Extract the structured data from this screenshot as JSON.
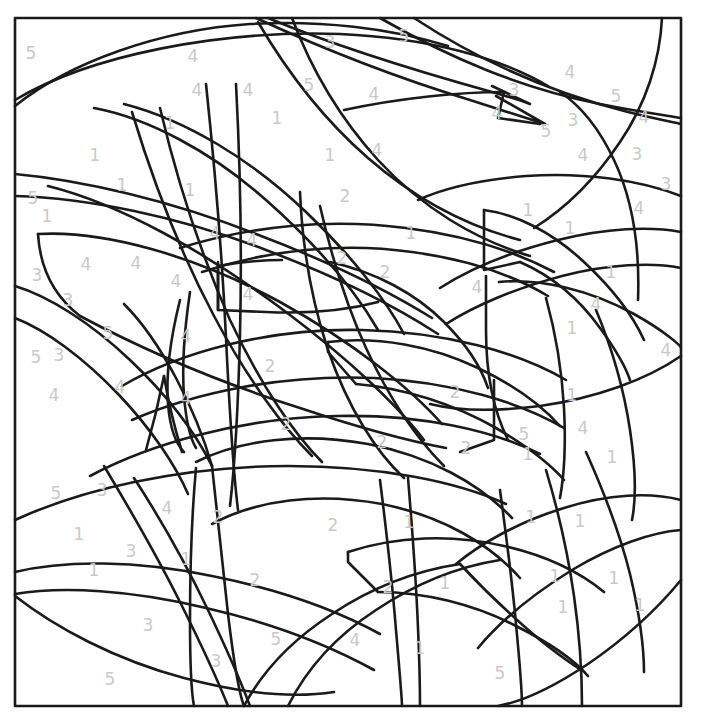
{
  "page": {
    "type": "color-by-number",
    "width": 702,
    "height": 726,
    "background_color": "#ffffff",
    "line_color": "#1a1a1a",
    "number_color": "#c9c9c9"
  },
  "frame": {
    "x": 15,
    "y": 18,
    "width": 666,
    "height": 688,
    "stroke_width": 2.6
  },
  "legend": {
    "palette_numbers": [
      "1",
      "2",
      "3",
      "4",
      "5"
    ]
  },
  "numbers": [
    {
      "label": "5",
      "x": 31,
      "y": 53
    },
    {
      "label": "4",
      "x": 193,
      "y": 56
    },
    {
      "label": "3",
      "x": 330,
      "y": 42
    },
    {
      "label": "5",
      "x": 404,
      "y": 36
    },
    {
      "label": "4",
      "x": 570,
      "y": 72
    },
    {
      "label": "3",
      "x": 514,
      "y": 90
    },
    {
      "label": "5",
      "x": 616,
      "y": 96
    },
    {
      "label": "4",
      "x": 197,
      "y": 90
    },
    {
      "label": "4",
      "x": 248,
      "y": 90
    },
    {
      "label": "5",
      "x": 309,
      "y": 85
    },
    {
      "label": "4",
      "x": 374,
      "y": 94
    },
    {
      "label": "4",
      "x": 497,
      "y": 113
    },
    {
      "label": "5",
      "x": 546,
      "y": 131
    },
    {
      "label": "3",
      "x": 573,
      "y": 120
    },
    {
      "label": "4",
      "x": 644,
      "y": 117
    },
    {
      "label": "1",
      "x": 170,
      "y": 123
    },
    {
      "label": "1",
      "x": 277,
      "y": 118
    },
    {
      "label": "1",
      "x": 330,
      "y": 155
    },
    {
      "label": "4",
      "x": 377,
      "y": 150
    },
    {
      "label": "4",
      "x": 583,
      "y": 155
    },
    {
      "label": "3",
      "x": 637,
      "y": 154
    },
    {
      "label": "1",
      "x": 95,
      "y": 155
    },
    {
      "label": "1",
      "x": 122,
      "y": 185
    },
    {
      "label": "1",
      "x": 190,
      "y": 190
    },
    {
      "label": "5",
      "x": 33,
      "y": 198
    },
    {
      "label": "2",
      "x": 345,
      "y": 196
    },
    {
      "label": "3",
      "x": 666,
      "y": 184
    },
    {
      "label": "1",
      "x": 528,
      "y": 210
    },
    {
      "label": "4",
      "x": 639,
      "y": 208
    },
    {
      "label": "1",
      "x": 47,
      "y": 216
    },
    {
      "label": "1",
      "x": 570,
      "y": 228
    },
    {
      "label": "4",
      "x": 215,
      "y": 233
    },
    {
      "label": "4",
      "x": 252,
      "y": 240
    },
    {
      "label": "1",
      "x": 411,
      "y": 233
    },
    {
      "label": "2",
      "x": 342,
      "y": 258
    },
    {
      "label": "4",
      "x": 86,
      "y": 264
    },
    {
      "label": "4",
      "x": 136,
      "y": 263
    },
    {
      "label": "1",
      "x": 611,
      "y": 272
    },
    {
      "label": "3",
      "x": 37,
      "y": 275
    },
    {
      "label": "4",
      "x": 176,
      "y": 281
    },
    {
      "label": "2",
      "x": 385,
      "y": 272
    },
    {
      "label": "4",
      "x": 477,
      "y": 287
    },
    {
      "label": "3",
      "x": 68,
      "y": 300
    },
    {
      "label": "4",
      "x": 248,
      "y": 294
    },
    {
      "label": "4",
      "x": 596,
      "y": 304
    },
    {
      "label": "1",
      "x": 572,
      "y": 328
    },
    {
      "label": "5",
      "x": 108,
      "y": 333
    },
    {
      "label": "4",
      "x": 186,
      "y": 336
    },
    {
      "label": "2",
      "x": 270,
      "y": 366
    },
    {
      "label": "4",
      "x": 666,
      "y": 350
    },
    {
      "label": "5",
      "x": 36,
      "y": 357
    },
    {
      "label": "3",
      "x": 59,
      "y": 355
    },
    {
      "label": "4",
      "x": 120,
      "y": 387
    },
    {
      "label": "4",
      "x": 54,
      "y": 395
    },
    {
      "label": "4",
      "x": 186,
      "y": 398
    },
    {
      "label": "2",
      "x": 455,
      "y": 392
    },
    {
      "label": "1",
      "x": 572,
      "y": 395
    },
    {
      "label": "2",
      "x": 286,
      "y": 424
    },
    {
      "label": "2",
      "x": 382,
      "y": 442
    },
    {
      "label": "2",
      "x": 466,
      "y": 448
    },
    {
      "label": "5",
      "x": 524,
      "y": 434
    },
    {
      "label": "4",
      "x": 583,
      "y": 428
    },
    {
      "label": "1",
      "x": 528,
      "y": 454
    },
    {
      "label": "1",
      "x": 612,
      "y": 457
    },
    {
      "label": "5",
      "x": 56,
      "y": 493
    },
    {
      "label": "3",
      "x": 102,
      "y": 490
    },
    {
      "label": "4",
      "x": 167,
      "y": 508
    },
    {
      "label": "2",
      "x": 218,
      "y": 517
    },
    {
      "label": "2",
      "x": 333,
      "y": 525
    },
    {
      "label": "1",
      "x": 409,
      "y": 522
    },
    {
      "label": "1",
      "x": 531,
      "y": 517
    },
    {
      "label": "1",
      "x": 580,
      "y": 521
    },
    {
      "label": "1",
      "x": 79,
      "y": 534
    },
    {
      "label": "3",
      "x": 131,
      "y": 551
    },
    {
      "label": "1",
      "x": 186,
      "y": 559
    },
    {
      "label": "1",
      "x": 94,
      "y": 570
    },
    {
      "label": "2",
      "x": 255,
      "y": 580
    },
    {
      "label": "2",
      "x": 388,
      "y": 587
    },
    {
      "label": "1",
      "x": 445,
      "y": 583
    },
    {
      "label": "1",
      "x": 555,
      "y": 576
    },
    {
      "label": "1",
      "x": 614,
      "y": 578
    },
    {
      "label": "1",
      "x": 640,
      "y": 605
    },
    {
      "label": "3",
      "x": 148,
      "y": 625
    },
    {
      "label": "5",
      "x": 276,
      "y": 639
    },
    {
      "label": "4",
      "x": 355,
      "y": 640
    },
    {
      "label": "1",
      "x": 420,
      "y": 648
    },
    {
      "label": "1",
      "x": 563,
      "y": 607
    },
    {
      "label": "3",
      "x": 216,
      "y": 661
    },
    {
      "label": "5",
      "x": 110,
      "y": 679
    },
    {
      "label": "5",
      "x": 500,
      "y": 673
    }
  ],
  "strokes": {
    "count": 64,
    "description": "hand-drawn style curved outlines forming overlapping leaf, stem and branch shapes"
  }
}
